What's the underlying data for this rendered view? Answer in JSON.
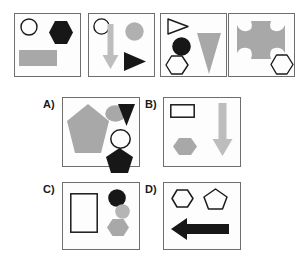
{
  "puzzle": {
    "type": "visual-analogy-shape-matrix",
    "colors": {
      "panel_border": "#6e6e6e",
      "panel_fill": "#fdfdfd",
      "shape_black": "#171717",
      "shape_gray_mid": "#a8a8a8",
      "shape_gray_light": "#bdbdbd",
      "shape_outline": "#1a1a1a",
      "label_text": "#1a1a1a",
      "background": "#ffffff"
    },
    "prompt_row": {
      "name": "prompt-row",
      "panels": [
        {
          "id": "prompt-1",
          "shapes": [
            {
              "name": "circle-outline",
              "kind": "circle",
              "fill": "none",
              "stroke": "#1a1a1a"
            },
            {
              "name": "hexagon-black",
              "kind": "hexagon",
              "fill": "#171717",
              "stroke": "none"
            },
            {
              "name": "rectangle-gray",
              "kind": "rectangle",
              "fill": "#a8a8a8",
              "stroke": "none"
            }
          ]
        },
        {
          "id": "prompt-2",
          "shapes": [
            {
              "name": "circle-outline",
              "kind": "circle",
              "fill": "none",
              "stroke": "#1a1a1a"
            },
            {
              "name": "arrow-down-gray",
              "kind": "arrow-down",
              "fill": "#bdbdbd",
              "stroke": "none"
            },
            {
              "name": "circle-gray",
              "kind": "circle",
              "fill": "#b0b0b0",
              "stroke": "none"
            },
            {
              "name": "triangle-right-black",
              "kind": "triangle-right",
              "fill": "#171717",
              "stroke": "none"
            }
          ]
        },
        {
          "id": "prompt-3",
          "shapes": [
            {
              "name": "triangle-right-outline",
              "kind": "triangle-right",
              "fill": "none",
              "stroke": "#1a1a1a"
            },
            {
              "name": "circle-black",
              "kind": "circle",
              "fill": "#171717",
              "stroke": "none"
            },
            {
              "name": "hexagon-outline",
              "kind": "hexagon",
              "fill": "none",
              "stroke": "#1a1a1a"
            },
            {
              "name": "triangle-down-gray",
              "kind": "triangle-down",
              "fill": "#a8a8a8",
              "stroke": "none"
            }
          ]
        },
        {
          "id": "prompt-4",
          "shapes": [
            {
              "name": "cross-gray",
              "kind": "cross-rounded",
              "fill": "#a8a8a8",
              "stroke": "none"
            },
            {
              "name": "hexagon-outline",
              "kind": "hexagon",
              "fill": "none",
              "stroke": "#1a1a1a"
            }
          ]
        }
      ]
    },
    "options": [
      {
        "id": "option-a",
        "label": "A)",
        "shapes": [
          {
            "name": "pentagon-gray",
            "kind": "pentagon",
            "fill": "#a8a8a8",
            "stroke": "none"
          },
          {
            "name": "ellipse-gray",
            "kind": "ellipse",
            "fill": "#a8a8a8",
            "stroke": "none"
          },
          {
            "name": "triangle-down-black",
            "kind": "triangle-down",
            "fill": "#171717",
            "stroke": "none"
          },
          {
            "name": "circle-outline",
            "kind": "circle",
            "fill": "none",
            "stroke": "#1a1a1a"
          },
          {
            "name": "pentagon-black",
            "kind": "pentagon",
            "fill": "#171717",
            "stroke": "none"
          }
        ]
      },
      {
        "id": "option-b",
        "label": "B)",
        "shapes": [
          {
            "name": "rectangle-outline",
            "kind": "rectangle",
            "fill": "none",
            "stroke": "#1a1a1a"
          },
          {
            "name": "hexagon-gray",
            "kind": "hexagon",
            "fill": "#a8a8a8",
            "stroke": "none"
          },
          {
            "name": "arrow-down-gray",
            "kind": "arrow-down",
            "fill": "#bdbdbd",
            "stroke": "none"
          }
        ]
      },
      {
        "id": "option-c",
        "label": "C)",
        "shapes": [
          {
            "name": "rectangle-outline",
            "kind": "rectangle",
            "fill": "none",
            "stroke": "#1a1a1a"
          },
          {
            "name": "circle-black",
            "kind": "circle",
            "fill": "#171717",
            "stroke": "none"
          },
          {
            "name": "circle-gray",
            "kind": "circle",
            "fill": "#b5b5b5",
            "stroke": "none"
          },
          {
            "name": "hexagon-gray",
            "kind": "hexagon",
            "fill": "#a8a8a8",
            "stroke": "none"
          }
        ]
      },
      {
        "id": "option-d",
        "label": "D)",
        "shapes": [
          {
            "name": "hexagon-outline",
            "kind": "hexagon",
            "fill": "none",
            "stroke": "#1a1a1a"
          },
          {
            "name": "pentagon-outline",
            "kind": "pentagon",
            "fill": "none",
            "stroke": "#1a1a1a"
          },
          {
            "name": "arrow-left-black",
            "kind": "arrow-left",
            "fill": "#171717",
            "stroke": "none"
          }
        ]
      }
    ]
  }
}
